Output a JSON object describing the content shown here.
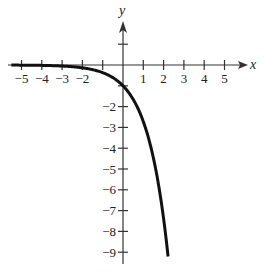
{
  "chart_data": {
    "type": "line",
    "title": "",
    "xlabel": "x",
    "ylabel": "y",
    "xlim": [
      -5.5,
      6.1
    ],
    "ylim": [
      -9.5,
      2.0
    ],
    "grid": false,
    "legend": null,
    "x_ticks": [
      -5,
      -4,
      -3,
      -2,
      -1,
      1,
      2,
      3,
      4,
      5
    ],
    "x_tick_labels": [
      "−5",
      "−4",
      "−3",
      "−2",
      "",
      "1",
      "2",
      "3",
      "4",
      "5"
    ],
    "y_ticks": [
      1,
      -1,
      -2,
      -3,
      -4,
      -5,
      -6,
      -7,
      -8,
      -9
    ],
    "y_tick_labels": [
      "",
      "",
      "−2",
      "−3",
      "−4",
      "−5",
      "−6",
      "−7",
      "−8",
      "−9"
    ],
    "series": [
      {
        "name": "y = -e^x",
        "function": "-exp(x)",
        "x_range": [
          -5.5,
          2.22
        ],
        "points": [
          [
            -5,
            -0.007
          ],
          [
            -4,
            -0.018
          ],
          [
            -3,
            -0.05
          ],
          [
            -2,
            -0.135
          ],
          [
            -1,
            -0.368
          ],
          [
            0,
            -1
          ],
          [
            0.5,
            -1.65
          ],
          [
            1,
            -2.72
          ],
          [
            1.5,
            -4.48
          ],
          [
            2,
            -7.39
          ],
          [
            2.22,
            -9.2
          ]
        ],
        "color": "#111111"
      }
    ]
  }
}
